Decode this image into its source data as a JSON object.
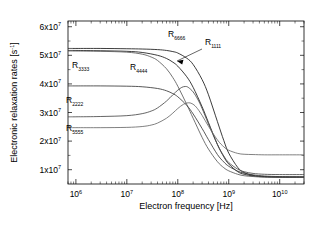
{
  "chart_data": {
    "type": "line",
    "title": "",
    "xlabel": "Electron frequency [Hz]",
    "ylabel": "Electronic relaxation rates [s-1]",
    "ylabel_display": "Electronic relaxation rates [s",
    "ylabel_sup": "-1",
    "ylabel_tail": "]",
    "xscale": "log",
    "yscale": "linear",
    "xlim": [
      700000,
      30000000000
    ],
    "ylim": [
      5000000,
      62000000
    ],
    "grid": false,
    "legend": "inline-annotations",
    "x_ticks": [
      {
        "value": 1000000,
        "mantissa": "10",
        "exponent": "6"
      },
      {
        "value": 10000000,
        "mantissa": "10",
        "exponent": "7"
      },
      {
        "value": 100000000,
        "mantissa": "10",
        "exponent": "8"
      },
      {
        "value": 1000000000,
        "mantissa": "10",
        "exponent": "9"
      },
      {
        "value": 10000000000,
        "mantissa": "10",
        "exponent": "10"
      }
    ],
    "y_ticks": [
      {
        "value": 10000000,
        "mantissa": "1x10",
        "exponent": "7"
      },
      {
        "value": 20000000,
        "mantissa": "2x10",
        "exponent": "7"
      },
      {
        "value": 30000000,
        "mantissa": "3x10",
        "exponent": "7"
      },
      {
        "value": 40000000,
        "mantissa": "4x10",
        "exponent": "7"
      },
      {
        "value": 50000000,
        "mantissa": "5x10",
        "exponent": "7"
      },
      {
        "value": 60000000,
        "mantissa": "6x10",
        "exponent": "7"
      }
    ],
    "series": [
      {
        "name": "R1111",
        "label_base": "R",
        "label_sub": "1111",
        "color": "#1a1a1a",
        "annotated_with_arrow": true,
        "label_x": 205,
        "label_y": 45,
        "points": [
          [
            700000,
            51700000
          ],
          [
            1000000,
            51700000
          ],
          [
            3000000,
            51600000
          ],
          [
            10000000,
            51400000
          ],
          [
            20000000,
            51000000
          ],
          [
            40000000,
            50000000
          ],
          [
            60000000,
            48900000
          ],
          [
            80000000,
            47600000
          ],
          [
            100000000,
            46200000
          ],
          [
            150000000,
            42500000
          ],
          [
            200000000,
            38800000
          ],
          [
            300000000,
            32000000
          ],
          [
            400000000,
            26500000
          ],
          [
            600000000,
            18800000
          ],
          [
            800000000,
            14500000
          ],
          [
            1000000000,
            12000000
          ],
          [
            1500000000,
            9300000
          ],
          [
            2000000000,
            8400000
          ],
          [
            3000000000,
            7800000
          ],
          [
            5000000000,
            7500000
          ],
          [
            10000000000,
            7400000
          ],
          [
            30000000000,
            7400000
          ]
        ]
      },
      {
        "name": "R6666",
        "label_base": "R",
        "label_sub": "6666",
        "color": "#1a1a1a",
        "annotated_with_arrow": false,
        "label_x": 168,
        "label_y": 37,
        "points": [
          [
            700000,
            52400000
          ],
          [
            1000000,
            52400000
          ],
          [
            3000000,
            52400000
          ],
          [
            10000000,
            52300000
          ],
          [
            20000000,
            52200000
          ],
          [
            40000000,
            52000000
          ],
          [
            60000000,
            51700000
          ],
          [
            80000000,
            51300000
          ],
          [
            100000000,
            50800000
          ],
          [
            150000000,
            49000000
          ],
          [
            200000000,
            46800000
          ],
          [
            300000000,
            41500000
          ],
          [
            400000000,
            36200000
          ],
          [
            600000000,
            26800000
          ],
          [
            800000000,
            20200000
          ],
          [
            1000000000,
            15800000
          ],
          [
            1500000000,
            10800000
          ],
          [
            2000000000,
            9000000
          ],
          [
            3000000000,
            8000000
          ],
          [
            5000000000,
            7600000
          ],
          [
            10000000000,
            7400000
          ],
          [
            30000000000,
            7400000
          ]
        ]
      },
      {
        "name": "R4444",
        "label_base": "R",
        "label_sub": "4444",
        "color": "#5a5a5a",
        "annotated_with_arrow": false,
        "label_x": 130,
        "label_y": 70,
        "points": [
          [
            700000,
            51500000
          ],
          [
            1000000,
            51500000
          ],
          [
            3000000,
            51400000
          ],
          [
            10000000,
            51100000
          ],
          [
            20000000,
            50400000
          ],
          [
            30000000,
            49400000
          ],
          [
            40000000,
            48200000
          ],
          [
            60000000,
            45300000
          ],
          [
            80000000,
            42200000
          ],
          [
            100000000,
            39200000
          ],
          [
            150000000,
            32800000
          ],
          [
            200000000,
            28000000
          ],
          [
            300000000,
            21300000
          ],
          [
            400000000,
            17200000
          ],
          [
            600000000,
            12800000
          ],
          [
            800000000,
            10700000
          ],
          [
            1000000000,
            9600000
          ],
          [
            1500000000,
            8400000
          ],
          [
            2000000000,
            7900000
          ],
          [
            3000000000,
            7600000
          ],
          [
            5000000000,
            7400000
          ],
          [
            10000000000,
            7400000
          ],
          [
            30000000000,
            7400000
          ]
        ]
      },
      {
        "name": "R3333",
        "label_base": "R",
        "label_sub": "3333",
        "color": "#3a3a3a",
        "annotated_with_arrow": false,
        "label_x": 72,
        "label_y": 68,
        "points": [
          [
            700000,
            39300000
          ],
          [
            1000000,
            39300000
          ],
          [
            3000000,
            39300000
          ],
          [
            10000000,
            39200000
          ],
          [
            20000000,
            39000000
          ],
          [
            40000000,
            38400000
          ],
          [
            60000000,
            37600000
          ],
          [
            80000000,
            36600000
          ],
          [
            100000000,
            35500000
          ],
          [
            150000000,
            32500000
          ],
          [
            200000000,
            29500000
          ],
          [
            300000000,
            24400000
          ],
          [
            400000000,
            20500000
          ],
          [
            600000000,
            15300000
          ],
          [
            800000000,
            12700000
          ],
          [
            1000000000,
            11200000
          ],
          [
            1500000000,
            9500000
          ],
          [
            2000000000,
            8800000
          ],
          [
            3000000000,
            8200000
          ],
          [
            5000000000,
            7800000
          ],
          [
            10000000000,
            7600000
          ],
          [
            30000000000,
            7500000
          ]
        ]
      },
      {
        "name": "R2222",
        "label_base": "R",
        "label_sub": "2222",
        "color": "#4a4a4a",
        "annotated_with_arrow": false,
        "label_x": 66,
        "label_y": 103,
        "points": [
          [
            700000,
            28500000
          ],
          [
            1000000,
            28500000
          ],
          [
            3000000,
            28600000
          ],
          [
            10000000,
            28900000
          ],
          [
            20000000,
            29600000
          ],
          [
            30000000,
            30500000
          ],
          [
            40000000,
            31600000
          ],
          [
            60000000,
            34000000
          ],
          [
            80000000,
            36200000
          ],
          [
            100000000,
            37800000
          ],
          [
            120000000,
            38800000
          ],
          [
            140000000,
            39100000
          ],
          [
            160000000,
            38800000
          ],
          [
            200000000,
            37200000
          ],
          [
            250000000,
            34400000
          ],
          [
            300000000,
            31400000
          ],
          [
            400000000,
            26000000
          ],
          [
            600000000,
            18800000
          ],
          [
            800000000,
            14800000
          ],
          [
            1000000000,
            12500000
          ],
          [
            1500000000,
            10200000
          ],
          [
            2000000000,
            9300000
          ],
          [
            3000000000,
            8700000
          ],
          [
            5000000000,
            8400000
          ],
          [
            10000000000,
            8300000
          ],
          [
            30000000000,
            8300000
          ]
        ]
      },
      {
        "name": "R5555",
        "label_base": "R",
        "label_sub": "5555",
        "color": "#6a6a6a",
        "annotated_with_arrow": false,
        "label_x": 66,
        "label_y": 131,
        "points": [
          [
            700000,
            24700000
          ],
          [
            1000000,
            24700000
          ],
          [
            3000000,
            24700000
          ],
          [
            10000000,
            24800000
          ],
          [
            20000000,
            25100000
          ],
          [
            30000000,
            25600000
          ],
          [
            40000000,
            26300000
          ],
          [
            60000000,
            28000000
          ],
          [
            80000000,
            29800000
          ],
          [
            100000000,
            31400000
          ],
          [
            130000000,
            32900000
          ],
          [
            160000000,
            33400000
          ],
          [
            190000000,
            33100000
          ],
          [
            230000000,
            31900000
          ],
          [
            300000000,
            29000000
          ],
          [
            400000000,
            25200000
          ],
          [
            600000000,
            20400000
          ],
          [
            800000000,
            18000000
          ],
          [
            1000000000,
            16800000
          ],
          [
            1500000000,
            15700000
          ],
          [
            2000000000,
            15400000
          ],
          [
            3000000000,
            15300000
          ],
          [
            5000000000,
            15200000
          ],
          [
            10000000000,
            15200000
          ],
          [
            30000000000,
            15200000
          ]
        ]
      }
    ]
  }
}
